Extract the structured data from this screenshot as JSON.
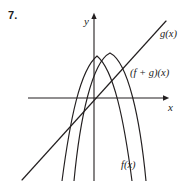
{
  "figure": {
    "problem_number": "7.",
    "background_color": "#ffffff",
    "stroke_color": "#231f20",
    "width": 189,
    "height": 181
  },
  "axes": {
    "y_label": "y",
    "x_label": "x",
    "origin": {
      "x": 94,
      "y": 98
    },
    "x_axis": {
      "x_start": 28,
      "x_end": 168,
      "y": 98,
      "arrow": "right"
    },
    "y_axis": {
      "y_start": 15,
      "y_end": 181,
      "x": 94,
      "arrow": "up"
    }
  },
  "curves": {
    "g": {
      "label": "g(x)",
      "type": "line",
      "description": "increasing straight line through the origin",
      "path": "M22,180 L166,21"
    },
    "fg": {
      "label": "(f + g)(x)",
      "type": "parabola",
      "description": "downward-opening parabola, narrower, vertex left of the f vertex",
      "path": "M62,181 C70,120 80,70 97,56 C114,70 124,120 132,181"
    },
    "f": {
      "label": "f(x)",
      "type": "parabola",
      "description": "downward-opening parabola, vertex right of the y-axis",
      "path": "M74,181 C80,118 92,62 110,53 C128,62 140,118 146,181"
    }
  },
  "annotations": {
    "intersection_note": "the two parabolas cross on the y-axis",
    "intersection_point": {
      "x": 94,
      "y": 58
    }
  }
}
